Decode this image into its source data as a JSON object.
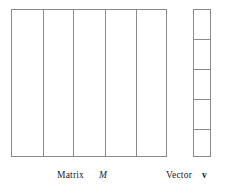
{
  "figure": {
    "background_color": "#ffffff",
    "stroke_color": "#8a8a8a",
    "text_color": "#1a1a1a"
  },
  "matrix": {
    "caption_word": "Matrix",
    "symbol": "M",
    "columns": 5,
    "column_divider_positions": [
      31,
      61,
      93,
      124
    ]
  },
  "vector": {
    "caption_word": "Vector",
    "symbol": "v",
    "cells": 5,
    "row_divider_positions": [
      29,
      59,
      89,
      119
    ]
  }
}
